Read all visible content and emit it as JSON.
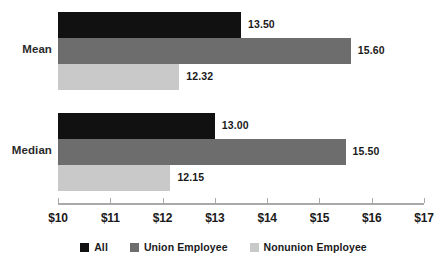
{
  "chart_data": {
    "type": "bar",
    "orientation": "horizontal",
    "title": "",
    "subtitle": "",
    "xlabel": "",
    "ylabel": "",
    "categories": [
      "Mean",
      "Median"
    ],
    "series": [
      {
        "name": "All",
        "color": "#111111",
        "values": [
          13.5,
          13.0
        ],
        "labels": [
          "13.50",
          "13.00"
        ]
      },
      {
        "name": "Union Employee",
        "color": "#6d6d6d",
        "values": [
          15.6,
          15.5
        ],
        "labels": [
          "15.60",
          "15.50"
        ]
      },
      {
        "name": "Nonunion Employee",
        "color": "#c9c9c9",
        "values": [
          12.32,
          12.15
        ],
        "labels": [
          "12.32",
          "12.15"
        ]
      }
    ],
    "xlim": [
      10,
      17
    ],
    "xtick_values": [
      10,
      11,
      12,
      13,
      14,
      15,
      16,
      17
    ],
    "xtick_labels": [
      "$10",
      "$11",
      "$12",
      "$13",
      "$14",
      "$15",
      "$16",
      "$17"
    ],
    "grid": false,
    "legend_position": "bottom"
  },
  "legend": {
    "items": [
      {
        "label": "All",
        "color": "#111111",
        "swatch_name": "legend-swatch-all"
      },
      {
        "label": "Union Employee",
        "color": "#6d6d6d",
        "swatch_name": "legend-swatch-union-employee"
      },
      {
        "label": "Nonunion Employee",
        "color": "#c9c9c9",
        "swatch_name": "legend-swatch-nonunion-employee"
      }
    ]
  }
}
